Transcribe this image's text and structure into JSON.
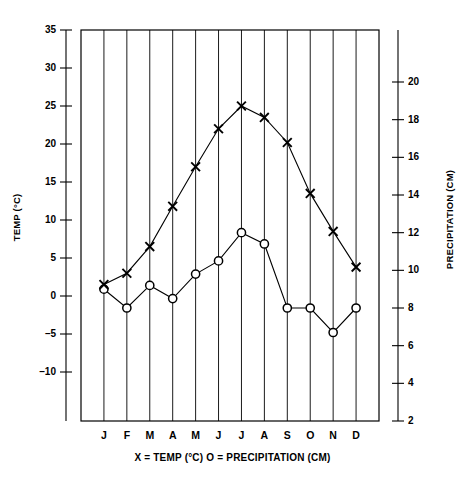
{
  "chart_data": {
    "type": "line",
    "title": "",
    "subtitle": "",
    "caption": "X = TEMP (°C)    O = PRECIPITATION (CM)",
    "categories": [
      "J",
      "F",
      "M",
      "A",
      "M",
      "J",
      "J",
      "A",
      "S",
      "O",
      "N",
      "D"
    ],
    "month_names": [
      "January",
      "February",
      "March",
      "April",
      "May",
      "June",
      "July",
      "August",
      "September",
      "October",
      "November",
      "December"
    ],
    "xlabel": "",
    "grid": true,
    "grid_orientation": "vertical",
    "legend_position": "below-axis",
    "left_axis": {
      "label": "TEMP (°C)",
      "ticks": [
        35,
        30,
        25,
        20,
        15,
        10,
        5,
        0,
        -5,
        -10
      ],
      "tick_labels": [
        "35",
        "30",
        "25",
        "20",
        "15",
        "10",
        "5",
        "0",
        "–5",
        "–10"
      ],
      "min": -10,
      "max": 35
    },
    "right_axis": {
      "label": "PRECIPITATION (CM)",
      "ticks": [
        20,
        18,
        16,
        14,
        12,
        10,
        8,
        6,
        4,
        2
      ],
      "tick_labels": [
        "20",
        "18",
        "16",
        "14",
        "12",
        "10",
        "8",
        "6",
        "4",
        "2"
      ],
      "min": 1,
      "max": 20
    },
    "series": [
      {
        "name": "TEMP (°C)",
        "marker": "X",
        "axis": "left",
        "unit": "°C",
        "values": [
          1.5,
          3.0,
          6.5,
          11.8,
          17.0,
          22.0,
          25.0,
          23.5,
          20.2,
          13.5,
          8.5,
          3.8
        ]
      },
      {
        "name": "PRECIPITATION (CM)",
        "marker": "O",
        "axis": "right",
        "unit": "CM",
        "values": [
          9.0,
          8.0,
          9.2,
          8.5,
          9.8,
          10.5,
          12.0,
          11.4,
          8.0,
          8.0,
          6.7,
          8.0
        ]
      }
    ]
  }
}
